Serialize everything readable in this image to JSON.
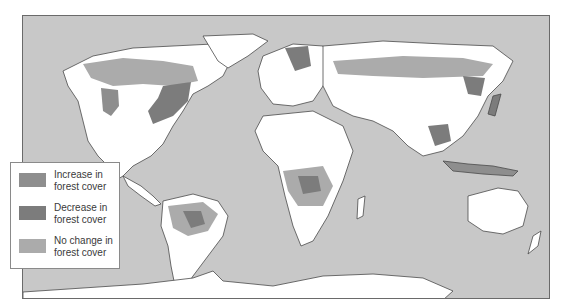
{
  "map": {
    "type": "world map",
    "colors": {
      "ocean": "#c8c8c8",
      "land": "#ffffff",
      "increase": "#8e8e8e",
      "decrease": "#7c7c7c",
      "no_change": "#ababab",
      "border": "#4a4a4a"
    }
  },
  "legend": {
    "items": [
      {
        "label_line1": "Increase in",
        "label_line2": "forest cover",
        "color": "#8e8e8e"
      },
      {
        "label_line1": "Decrease in",
        "label_line2": "forest cover",
        "color": "#7c7c7c"
      },
      {
        "label_line1": "No change in",
        "label_line2": "forest cover",
        "color": "#ababab"
      }
    ]
  }
}
